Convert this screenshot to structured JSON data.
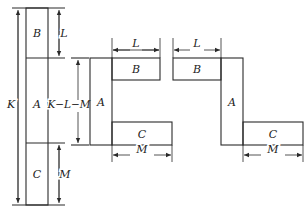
{
  "figure": {
    "left": {
      "labels": {
        "block_b": "B",
        "block_a": "A",
        "block_c": "C"
      },
      "dimensions": {
        "total": "K",
        "top": "L",
        "middle": "K−L−M",
        "bottom": "M"
      }
    },
    "middle": {
      "labels": {
        "block_b": "B",
        "block_a": "A",
        "block_c": "C"
      },
      "dimensions": {
        "top_width": "L",
        "bottom_width": "M"
      }
    },
    "right": {
      "labels": {
        "block_b": "B",
        "block_a": "A",
        "block_c": "C"
      },
      "dimensions": {
        "top_width": "L",
        "bottom_width": "M"
      }
    },
    "colors": {
      "stroke": "#2a2a2a",
      "background": "#ffffff"
    }
  }
}
